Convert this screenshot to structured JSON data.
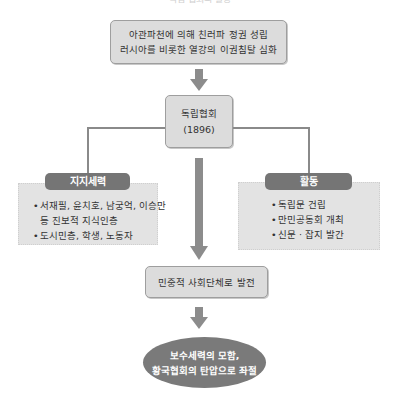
{
  "top_cut_text": "독립 협회의 활동",
  "top_box": {
    "line1": "아관파천에 의해 친러파 정권 성립",
    "line2": "러시아를 비롯한 열강의 이권침탈 심화"
  },
  "center_box": {
    "title": "독립협회",
    "year": "(1896)"
  },
  "support_panel": {
    "header": "지지세력",
    "items": [
      {
        "bullet": "•",
        "text": "서재필, 윤치호, 남궁억, 이승만",
        "cont": "등 진보적 지식인층"
      },
      {
        "bullet": "•",
        "text": "도시민층, 학생, 노동자"
      }
    ]
  },
  "activity_panel": {
    "header": "활동",
    "items": [
      {
        "bullet": "•",
        "text": "독립문 건립"
      },
      {
        "bullet": "•",
        "text": "만민공동회 개최"
      },
      {
        "bullet": "•",
        "text": "신문 · 잡지 발간"
      }
    ]
  },
  "result_box": {
    "text": "민중적 사회단체로 발전"
  },
  "final_ellipse": {
    "line1": "보수세력의 모함,",
    "line2": "황국협회의 탄압으로 좌절"
  },
  "colors": {
    "box_fill": "#dcdcdc",
    "box_border": "#9e9e9e",
    "panel_fill": "#e3e3e3",
    "header_fill": "#757575",
    "ellipse_fill": "#7a7a7a",
    "arrow": "#8c8c8c",
    "connector": "#8a8a8a"
  }
}
